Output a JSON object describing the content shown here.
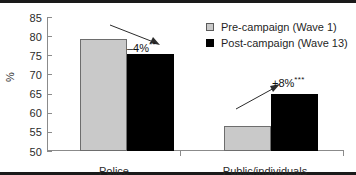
{
  "chart_data": {
    "type": "bar",
    "title": "",
    "subtitle": "",
    "xlabel": "",
    "ylabel": "%",
    "ylim": [
      50,
      85
    ],
    "yticks": [
      50,
      55,
      60,
      65,
      70,
      75,
      80,
      85
    ],
    "grid": false,
    "legend_position": "top-right",
    "categories": [
      "Police",
      "Public/individuals"
    ],
    "series": [
      {
        "name": "Pre-campaign (Wave 1)",
        "values": [
          79.3,
          56.6
        ],
        "color": "#c9c9c9"
      },
      {
        "name": "Post-campaign (Wave 13)",
        "values": [
          75.3,
          65.0
        ],
        "color": "#000000"
      }
    ],
    "annotations": [
      {
        "text": "–4%",
        "significance": "**",
        "group": "Police"
      },
      {
        "text": "+8%",
        "significance": "***",
        "group": "Public/individuals"
      }
    ]
  },
  "axis": {
    "y_title": "%",
    "y_tick_labels": [
      "85",
      "80",
      "75",
      "70",
      "65",
      "60",
      "55",
      "50"
    ],
    "x_tick_labels": [
      "Police",
      "Public/individuals"
    ]
  },
  "legend": {
    "items": [
      {
        "label": "Pre-campaign (Wave 1)",
        "swatch": "pre"
      },
      {
        "label": "Post-campaign (Wave 13)",
        "swatch": "post"
      }
    ]
  },
  "annotations": {
    "police": {
      "value": "–4%",
      "stars": "**"
    },
    "public": {
      "value": "+8%",
      "stars": "***"
    }
  }
}
